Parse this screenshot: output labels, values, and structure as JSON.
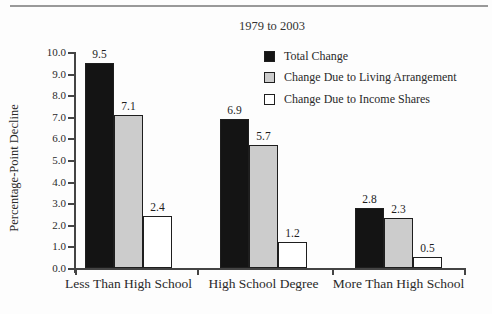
{
  "chart_data": {
    "type": "bar",
    "title": "1979 to 2003",
    "xlabel": "",
    "ylabel": "Percentage-Point Decline",
    "categories": [
      "Less Than High School",
      "High School Degree",
      "More Than High School"
    ],
    "series": [
      {
        "name": "Total Change",
        "color": "#141414",
        "values": [
          9.5,
          6.9,
          2.8
        ]
      },
      {
        "name": "Change Due to Living Arrangement",
        "color": "#cccccc",
        "values": [
          7.1,
          5.7,
          2.3
        ]
      },
      {
        "name": "Change Due to Income Shares",
        "color": "#ffffff",
        "values": [
          2.4,
          1.2,
          0.5
        ]
      }
    ],
    "ylim": [
      0,
      10
    ],
    "yticks": [
      "0.0",
      "1.0",
      "2.0",
      "3.0",
      "4.0",
      "5.0",
      "6.0",
      "7.0",
      "8.0",
      "9.0",
      "10.0"
    ],
    "grid": false,
    "legend_position": "upper right",
    "bar_value_labels": true
  }
}
